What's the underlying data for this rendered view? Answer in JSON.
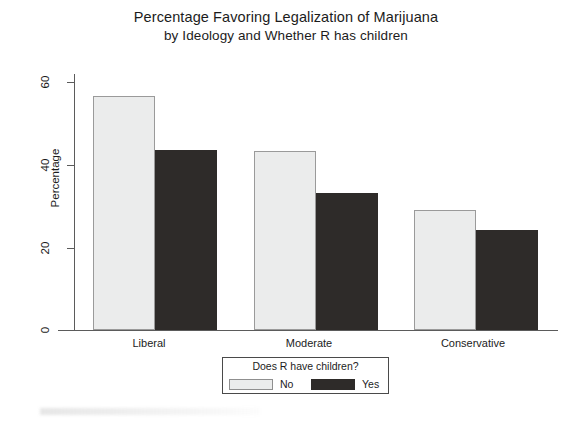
{
  "chart_data": {
    "type": "bar",
    "title": "Percentage Favoring Legalization of Marijuana",
    "subtitle": "by Ideology and Whether R has children",
    "xlabel": "",
    "ylabel": "Percentage",
    "ylim": [
      0,
      65
    ],
    "yticks": [
      0,
      20,
      40,
      60
    ],
    "ytick_labels": [
      "0",
      "20",
      "40",
      "60"
    ],
    "grid": false,
    "categories": [
      "Liberal",
      "Moderate",
      "Conservative"
    ],
    "series": [
      {
        "name": "No",
        "color": "#ebecec",
        "values": [
          59.5,
          45.4,
          30.5
        ]
      },
      {
        "name": "Yes",
        "color": "#2e2b29",
        "values": [
          45.6,
          34.8,
          25.3
        ]
      }
    ],
    "legend": {
      "title": "Does R have children?",
      "position": "bottom-center",
      "entries": [
        {
          "label": "No",
          "color": "#ebecec",
          "style": "light"
        },
        {
          "label": "Yes",
          "color": "#2e2b29",
          "style": "dark"
        }
      ]
    }
  }
}
